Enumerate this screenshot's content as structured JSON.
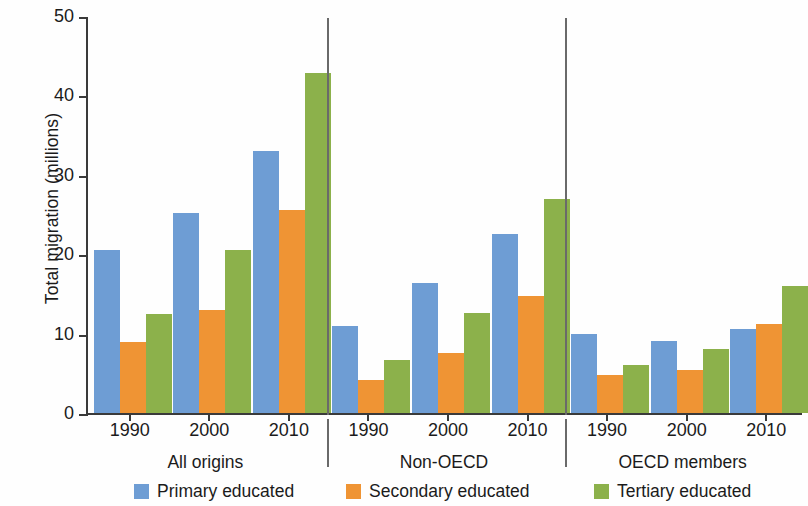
{
  "chart_data": {
    "type": "bar",
    "title": "",
    "xlabel": "",
    "ylabel": "Total migration (millions)",
    "ylim": [
      0,
      50
    ],
    "yticks": [
      0,
      10,
      20,
      30,
      40,
      50
    ],
    "ytick_labels": [
      "0",
      "10",
      "20",
      "30",
      "40",
      "50"
    ],
    "grid": false,
    "legend_position": "bottom",
    "group_labels": [
      "All origins",
      "Non-OECD",
      "OECD members"
    ],
    "categories": [
      "1990",
      "2000",
      "2010"
    ],
    "series": [
      {
        "name": "Primary educated",
        "color": "#6e9dd4",
        "values_by_group": {
          "All origins": [
            20.5,
            25.2,
            33.0
          ],
          "Non-OECD": [
            11.0,
            16.4,
            22.5
          ],
          "OECD members": [
            9.9,
            9.1,
            10.6
          ]
        }
      },
      {
        "name": "Secondary educated",
        "color": "#ef9434",
        "values_by_group": {
          "All origins": [
            9.0,
            13.0,
            25.6
          ],
          "Non-OECD": [
            4.2,
            7.5,
            14.8
          ],
          "OECD members": [
            4.8,
            5.4,
            11.2
          ]
        }
      },
      {
        "name": "Tertiary educated",
        "color": "#8cb14b",
        "values_by_group": {
          "All origins": [
            12.5,
            20.5,
            42.8
          ],
          "Non-OECD": [
            6.7,
            12.6,
            27.0
          ],
          "OECD members": [
            6.0,
            8.0,
            16.0
          ]
        }
      }
    ]
  },
  "axis": {
    "y_title": "Total migration (millions)",
    "y_ticks": [
      "50",
      "40",
      "30",
      "20",
      "10",
      "0"
    ]
  },
  "legend": {
    "items": [
      {
        "label": "Primary educated",
        "color": "#6e9dd4"
      },
      {
        "label": "Secondary educated",
        "color": "#ef9434"
      },
      {
        "label": "Tertiary educated",
        "color": "#8cb14b"
      }
    ]
  }
}
